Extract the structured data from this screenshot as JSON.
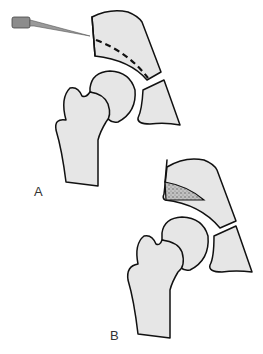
{
  "figure": {
    "panels": [
      {
        "label": "A",
        "description": "needle marking osteotomy line (dashed) above acetabulum"
      },
      {
        "label": "B",
        "description": "bone graft (stippled wedge) inserted above acetabulum"
      }
    ]
  },
  "colors": {
    "bone_fill": "#e6e6e6",
    "outline": "#111111",
    "graft_fill": "#9a9a9a",
    "needle_hub": "#8c8c8c",
    "label": "#333333"
  },
  "icons": {
    "needle": "needle-icon",
    "graft": "stippled-graft"
  }
}
